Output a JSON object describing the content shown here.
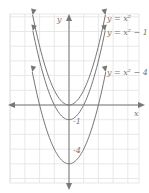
{
  "chart_data": {
    "type": "line",
    "title": "",
    "xlabel": "x",
    "ylabel": "y",
    "xlim": [
      -4,
      4.5
    ],
    "ylim": [
      -5.3,
      6.2
    ],
    "grid": true,
    "series": [
      {
        "name": "y = x²",
        "label": "y = x²",
        "a": 1,
        "k": 0,
        "vertex": [
          0,
          0
        ]
      },
      {
        "name": "y = x² − 1",
        "label": "y = x² − 1",
        "a": 1,
        "k": -1,
        "vertex": [
          0,
          -1
        ]
      },
      {
        "name": "y = x² − 4",
        "label": "y = x² − 4",
        "a": 1,
        "k": -4,
        "vertex": [
          0,
          -4
        ]
      }
    ],
    "annotations": [
      {
        "text": "-1",
        "at": [
          0,
          -1
        ]
      },
      {
        "text": "-4",
        "at": [
          0,
          -4
        ]
      }
    ]
  },
  "labels": {
    "x_axis": "x",
    "y_axis": "y",
    "curve1": "y = x²",
    "curve2": "y = x² − 1",
    "curve3": "y = x² − 4",
    "tick_m1": "-1",
    "tick_m4": "-4"
  },
  "colors": {
    "grid": "#e2e2e2",
    "axis": "#777777",
    "curve": "#777777"
  }
}
